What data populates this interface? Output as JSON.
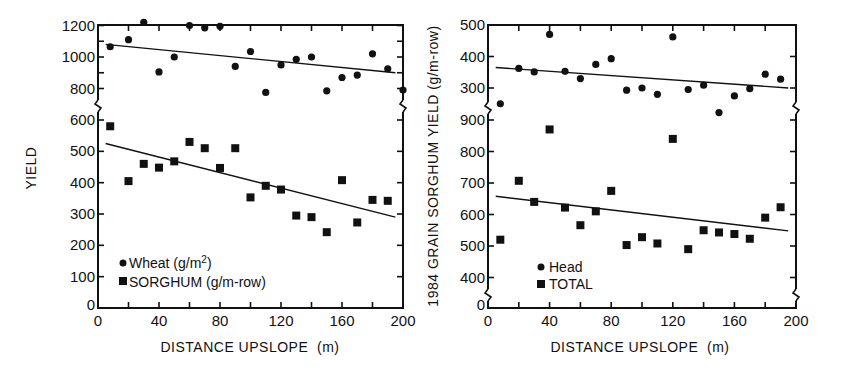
{
  "figure": {
    "background": "#ffffff",
    "ink": "#111111"
  },
  "chart_data": [
    {
      "type": "scatter",
      "title": "",
      "xlabel": "DISTANCE UPSLOPE (m)",
      "ylabel": "YIELD",
      "xlim": [
        0,
        200
      ],
      "x_ticks": [
        0,
        40,
        80,
        120,
        160,
        200
      ],
      "x_minor_ticks": [
        20,
        60,
        100,
        140,
        180
      ],
      "broken_y_axis": true,
      "y_segments": [
        {
          "name": "upper",
          "range": [
            700,
            1200
          ],
          "ticks": [
            800,
            1000,
            1200
          ]
        },
        {
          "name": "lower",
          "range": [
            0,
            600
          ],
          "ticks": [
            0,
            100,
            200,
            300,
            400,
            500,
            600
          ]
        }
      ],
      "grid": false,
      "legend_position": "lower-left",
      "series": [
        {
          "name": "Wheat (g/m2)",
          "legend_label": "Wheat (g/m",
          "legend_sup": "2",
          "legend_suffix": ")",
          "marker": "circle",
          "segment": "upper",
          "x": [
            8,
            20,
            30,
            40,
            50,
            60,
            70,
            80,
            90,
            100,
            110,
            120,
            130,
            140,
            150,
            160,
            170,
            180,
            190,
            200
          ],
          "y": [
            1065,
            1110,
            1220,
            905,
            1000,
            1200,
            1185,
            1195,
            940,
            1035,
            775,
            950,
            985,
            1000,
            785,
            870,
            885,
            1020,
            925,
            790
          ],
          "trendline": {
            "x": [
              5,
              195
            ],
            "y": [
              1080,
              900
            ]
          }
        },
        {
          "name": "SORGHUM (g/m-row)",
          "legend_label": "SORGHUM (g/m-row)",
          "legend_sup": "",
          "legend_suffix": "",
          "marker": "square",
          "segment": "lower",
          "x": [
            8,
            20,
            30,
            40,
            50,
            60,
            70,
            80,
            90,
            100,
            110,
            120,
            130,
            140,
            150,
            160,
            170,
            180,
            190
          ],
          "y": [
            580,
            405,
            460,
            448,
            468,
            530,
            510,
            447,
            510,
            353,
            390,
            378,
            295,
            290,
            242,
            408,
            273,
            345,
            342
          ],
          "trendline": {
            "x": [
              5,
              195
            ],
            "y": [
              525,
              290
            ]
          }
        }
      ]
    },
    {
      "type": "scatter",
      "title": "",
      "xlabel": "DISTANCE UPSLOPE (m)",
      "ylabel": "1984 GRAIN SORGHUM YIELD (g/m-row)",
      "xlim": [
        0,
        200
      ],
      "x_ticks": [
        0,
        40,
        80,
        120,
        160,
        200
      ],
      "x_minor_ticks": [
        20,
        60,
        100,
        140,
        180
      ],
      "broken_y_axis": true,
      "y_segments": [
        {
          "name": "upper",
          "range": [
            250,
            500
          ],
          "ticks": [
            300,
            400,
            500
          ]
        },
        {
          "name": "lower",
          "range": [
            300,
            900
          ],
          "ticks": [
            0,
            400,
            500,
            600,
            700,
            800,
            900
          ]
        }
      ],
      "grid": false,
      "legend_position": "lower-left",
      "series": [
        {
          "name": "Head",
          "legend_label": "Head",
          "marker": "circle",
          "segment": "upper",
          "x": [
            8,
            20,
            30,
            40,
            50,
            60,
            70,
            80,
            90,
            100,
            110,
            120,
            130,
            140,
            150,
            160,
            170,
            180,
            190
          ],
          "y": [
            250,
            362,
            351,
            470,
            353,
            330,
            375,
            393,
            293,
            300,
            280,
            462,
            295,
            309,
            222,
            275,
            298,
            344,
            328
          ],
          "trendline": {
            "x": [
              5,
              195
            ],
            "y": [
              365,
              300
            ]
          }
        },
        {
          "name": "TOTAL",
          "legend_label": "TOTAL",
          "marker": "square",
          "segment": "lower",
          "x": [
            8,
            20,
            30,
            40,
            50,
            60,
            70,
            80,
            90,
            100,
            110,
            120,
            130,
            140,
            150,
            160,
            170,
            180,
            190
          ],
          "y": [
            520,
            707,
            640,
            870,
            622,
            566,
            610,
            675,
            503,
            528,
            508,
            840,
            490,
            550,
            543,
            538,
            523,
            590,
            623
          ],
          "trendline": {
            "x": [
              5,
              195
            ],
            "y": [
              658,
              548
            ]
          }
        }
      ]
    }
  ],
  "panels": {
    "left": {
      "ylabel": "YIELD",
      "xlabel": "DISTANCE UPSLOPE  (m)",
      "x_tick_labels": [
        "0",
        "40",
        "80",
        "120",
        "160",
        "200"
      ],
      "y_tick_labels": [
        "1200",
        "1000",
        "800",
        "600",
        "500",
        "400",
        "300",
        "200",
        "100",
        "0"
      ],
      "legend": {
        "wheat": "Wheat (g/m",
        "wheat_sup": "2",
        "wheat_end": ")",
        "sorghum": "SORGHUM (g/m-row)"
      }
    },
    "right": {
      "ylabel": "1984 GRAIN SORGHUM YIELD (g/m-row)",
      "xlabel": "DISTANCE UPSLOPE  (m)",
      "x_tick_labels": [
        "0",
        "40",
        "80",
        "120",
        "160",
        "200"
      ],
      "y_tick_labels": [
        "500",
        "400",
        "300",
        "900",
        "800",
        "700",
        "600",
        "500",
        "400",
        "0"
      ],
      "legend": {
        "head": "Head",
        "total": "TOTAL"
      }
    }
  }
}
